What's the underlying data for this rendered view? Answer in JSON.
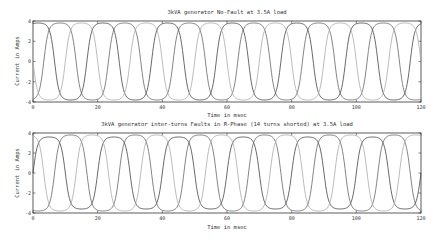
{
  "chart_data": [
    {
      "type": "line",
      "title": "3kVA generator No-Fault at 3.5A load",
      "xlabel": "Time in msec",
      "ylabel": "Current in Amps",
      "xlim": [
        0,
        120
      ],
      "ylim": [
        -4,
        4
      ],
      "xticks": [
        0,
        20,
        40,
        60,
        80,
        100,
        120
      ],
      "yticks": [
        -4,
        -2,
        0,
        2,
        4
      ],
      "grid": false,
      "legend": null,
      "frequency_hz": 50,
      "period_ms": 20,
      "series": [
        {
          "name": "Phase R",
          "amplitude": 3.8,
          "phase_deg": 60,
          "color": "#444444"
        },
        {
          "name": "Phase Y",
          "amplitude": 3.8,
          "phase_deg": -60,
          "color": "#666666"
        },
        {
          "name": "Phase B",
          "amplitude": 3.8,
          "phase_deg": 180,
          "color": "#aaaaaa"
        }
      ],
      "x_sample": [
        0,
        5,
        10,
        15,
        20
      ],
      "note": "Three-phase currents with flattened (clipped) peaks near ±3.8 A, 6 cycles over 120 ms"
    },
    {
      "type": "line",
      "title": "3kVA generator inter-turns Faults in R-Phase (14 turns shorted) at 3.5A load",
      "xlabel": "Time in msec",
      "ylabel": "Current in Amps",
      "xlim": [
        0,
        120
      ],
      "ylim": [
        -4,
        4
      ],
      "xticks": [
        0,
        20,
        40,
        60,
        80,
        100,
        120
      ],
      "yticks": [
        -4,
        -2,
        0,
        2,
        4
      ],
      "grid": false,
      "legend": null,
      "frequency_hz": 50,
      "period_ms": 20,
      "series": [
        {
          "name": "Phase R",
          "amplitude": 3.6,
          "phase_deg": 0,
          "color": "#444444"
        },
        {
          "name": "Phase Y",
          "amplitude": 3.8,
          "phase_deg": -120,
          "color": "#666666"
        },
        {
          "name": "Phase B",
          "amplitude": 3.8,
          "phase_deg": 120,
          "color": "#aaaaaa"
        }
      ],
      "note": "Three-phase currents under inter-turn fault; slightly distorted flattened peaks"
    }
  ],
  "panels": [
    {
      "title": "3kVA generator No-Fault at 3.5A load",
      "xlabel": "Time in msec",
      "ylabel": "Current in Amps"
    },
    {
      "title": "3kVA generator inter-turns Faults in R-Phase (14 turns shorted) at 3.5A load",
      "xlabel": "Time in msec",
      "ylabel": "Current in Amps"
    }
  ]
}
